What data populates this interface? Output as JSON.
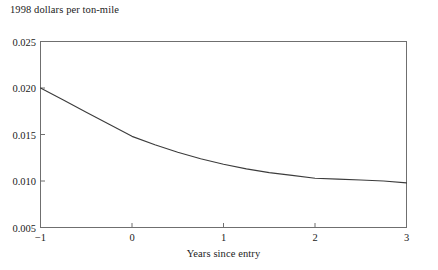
{
  "chart_data": {
    "type": "line",
    "title": "",
    "ylabel": "1998 dollars per ton-mile",
    "xlabel": "Years since entry",
    "xlim": [
      -1,
      3
    ],
    "ylim": [
      0.005,
      0.025
    ],
    "xticks": [
      -1,
      0,
      1,
      2,
      3
    ],
    "xtick_labels": [
      "−1",
      "0",
      "1",
      "2",
      "3"
    ],
    "yticks": [
      0.005,
      0.01,
      0.015,
      0.02,
      0.025
    ],
    "ytick_labels": [
      "0.005",
      "0.010",
      "0.015",
      "0.020",
      "0.025"
    ],
    "grid": false,
    "legend": "none",
    "frame": "full-box",
    "tick_direction": "in",
    "line_color": "#3c3c3c",
    "series": [
      {
        "name": "cost per ton-mile",
        "x": [
          -1.0,
          -0.75,
          -0.5,
          -0.25,
          0.0,
          0.25,
          0.5,
          0.75,
          1.0,
          1.25,
          1.5,
          1.75,
          2.0,
          2.25,
          2.5,
          2.75,
          3.0
        ],
        "values": [
          0.02,
          0.0187,
          0.0174,
          0.0161,
          0.0148,
          0.0139,
          0.0131,
          0.0124,
          0.0118,
          0.0113,
          0.0109,
          0.0106,
          0.0103,
          0.0102,
          0.0101,
          0.01,
          0.0098
        ]
      }
    ]
  }
}
